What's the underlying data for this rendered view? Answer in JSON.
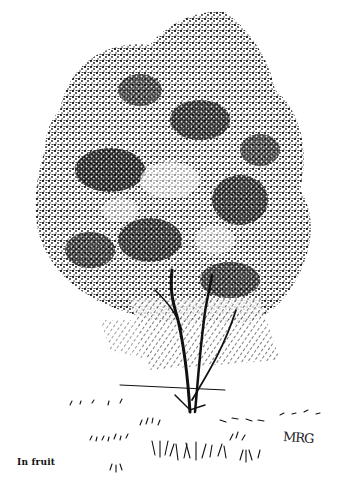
{
  "illustration": {
    "subject": "tree",
    "style": "pen-and-ink",
    "caption": "In fruit",
    "signature": "MRG",
    "colors": {
      "ink": "#111111",
      "paper": "#ffffff"
    }
  }
}
